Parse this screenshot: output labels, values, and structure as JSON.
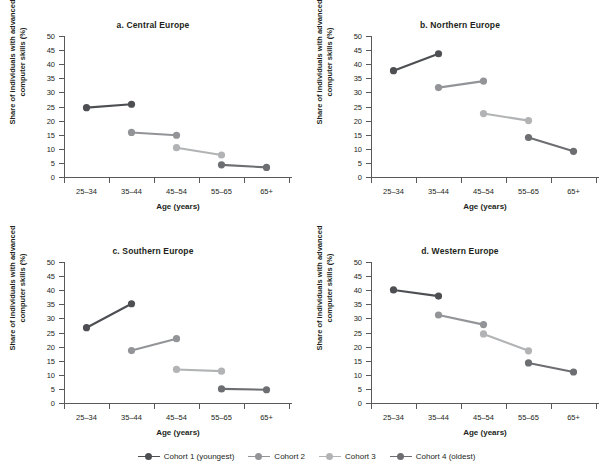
{
  "figure": {
    "background": "#ffffff",
    "axis_color": "#58595b",
    "text_color": "#231f20"
  },
  "legend": {
    "position": "bottom-center",
    "items": [
      {
        "label": "Cohort 1 (youngest)",
        "color": "#4d4f53"
      },
      {
        "label": "Cohort 2",
        "color": "#929497"
      },
      {
        "label": "Cohort 3",
        "color": "#b1b3b5"
      },
      {
        "label": "Cohort 4 (oldest)",
        "color": "#6d6e71"
      }
    ]
  },
  "axes": {
    "xlabel": "Age (years)",
    "ylabel": "Share of individuals with advanced computer skills (%)",
    "categories": [
      "25–34",
      "35–44",
      "45–54",
      "55–65",
      "65+"
    ],
    "yticks": [
      0,
      5,
      10,
      15,
      20,
      25,
      30,
      35,
      40,
      45,
      50
    ],
    "ylim": [
      0,
      50
    ],
    "grid": false
  },
  "chart_data": [
    {
      "type": "line",
      "title": "a. Central Europe",
      "xlabel": "Age (years)",
      "ylabel": "Share of individuals with advanced computer skills (%)",
      "categories": [
        "25–34",
        "35–44",
        "45–54",
        "55–65",
        "65+"
      ],
      "ylim": [
        0,
        50
      ],
      "grid": false,
      "series": [
        {
          "name": "Cohort 1 (youngest)",
          "color": "#4d4f53",
          "x": [
            "25–34",
            "35–44"
          ],
          "values": [
            24.6,
            25.8
          ]
        },
        {
          "name": "Cohort 2",
          "color": "#929497",
          "x": [
            "35–44",
            "45–54"
          ],
          "values": [
            15.8,
            14.8
          ]
        },
        {
          "name": "Cohort 3",
          "color": "#b1b3b5",
          "x": [
            "45–54",
            "55–65"
          ],
          "values": [
            10.4,
            7.8
          ]
        },
        {
          "name": "Cohort 4 (oldest)",
          "color": "#6d6e71",
          "x": [
            "55–65",
            "65+"
          ],
          "values": [
            4.3,
            3.4
          ]
        }
      ]
    },
    {
      "type": "line",
      "title": "b. Northern Europe",
      "xlabel": "Age (years)",
      "ylabel": "Share of individuals with advanced computer skills (%)",
      "categories": [
        "25–34",
        "35–44",
        "45–54",
        "55–65",
        "65+"
      ],
      "ylim": [
        0,
        50
      ],
      "grid": false,
      "series": [
        {
          "name": "Cohort 1 (youngest)",
          "color": "#4d4f53",
          "x": [
            "25–34",
            "35–44"
          ],
          "values": [
            37.7,
            43.7
          ]
        },
        {
          "name": "Cohort 2",
          "color": "#929497",
          "x": [
            "35–44",
            "45–54"
          ],
          "values": [
            31.7,
            34.0
          ]
        },
        {
          "name": "Cohort 3",
          "color": "#b1b3b5",
          "x": [
            "45–54",
            "55–65"
          ],
          "values": [
            22.5,
            20.0
          ]
        },
        {
          "name": "Cohort 4 (oldest)",
          "color": "#6d6e71",
          "x": [
            "55–65",
            "65+"
          ],
          "values": [
            14.0,
            9.1
          ]
        }
      ]
    },
    {
      "type": "line",
      "title": "c. Southern Europe",
      "xlabel": "Age (years)",
      "ylabel": "Share of individuals with advanced computer skills (%)",
      "categories": [
        "25–34",
        "35–44",
        "45–54",
        "55–65",
        "65+"
      ],
      "ylim": [
        0,
        50
      ],
      "grid": false,
      "series": [
        {
          "name": "Cohort 1 (youngest)",
          "color": "#4d4f53",
          "x": [
            "25–34",
            "35–44"
          ],
          "values": [
            26.7,
            35.2
          ]
        },
        {
          "name": "Cohort 2",
          "color": "#929497",
          "x": [
            "35–44",
            "45–54"
          ],
          "values": [
            18.6,
            22.8
          ]
        },
        {
          "name": "Cohort 3",
          "color": "#b1b3b5",
          "x": [
            "45–54",
            "55–65"
          ],
          "values": [
            11.9,
            11.3
          ]
        },
        {
          "name": "Cohort 4 (oldest)",
          "color": "#6d6e71",
          "x": [
            "55–65",
            "65+"
          ],
          "values": [
            5.0,
            4.7
          ]
        }
      ]
    },
    {
      "type": "line",
      "title": "d. Western Europe",
      "xlabel": "Age (years)",
      "ylabel": "Share of individuals with advanced computer skills (%)",
      "categories": [
        "25–34",
        "35–44",
        "45–54",
        "55–65",
        "65+"
      ],
      "ylim": [
        0,
        50
      ],
      "grid": false,
      "series": [
        {
          "name": "Cohort 1 (youngest)",
          "color": "#4d4f53",
          "x": [
            "25–34",
            "35–44"
          ],
          "values": [
            40.1,
            37.9
          ]
        },
        {
          "name": "Cohort 2",
          "color": "#929497",
          "x": [
            "35–44",
            "45–54"
          ],
          "values": [
            31.2,
            27.8
          ]
        },
        {
          "name": "Cohort 3",
          "color": "#b1b3b5",
          "x": [
            "45–54",
            "55–65"
          ],
          "values": [
            24.5,
            18.5
          ]
        },
        {
          "name": "Cohort 4 (oldest)",
          "color": "#6d6e71",
          "x": [
            "55–65",
            "65+"
          ],
          "values": [
            14.2,
            11.0
          ]
        }
      ]
    }
  ]
}
